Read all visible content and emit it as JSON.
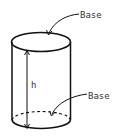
{
  "diagram": {
    "shape": "cylinder",
    "labels": {
      "top_base": "Base",
      "bottom_base": "Base",
      "height": "h"
    },
    "colors": {
      "stroke": "#111111",
      "text": "#333333",
      "background": "#ffffff"
    }
  }
}
